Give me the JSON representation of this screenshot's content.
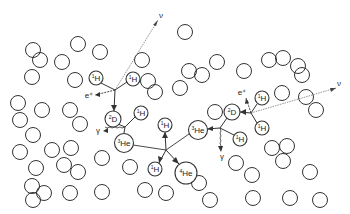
{
  "diagram": {
    "stroke_color": "#333333",
    "line_color": "#555555",
    "background": "#ffffff",
    "particle_radius": 7.5,
    "particles": [
      [
        33,
        50
      ],
      [
        40,
        60
      ],
      [
        62,
        62
      ],
      [
        78,
        44
      ],
      [
        100,
        52
      ],
      [
        32,
        77
      ],
      [
        75,
        80
      ],
      [
        18,
        103
      ],
      [
        42,
        110
      ],
      [
        70,
        110
      ],
      [
        20,
        120
      ],
      [
        33,
        135
      ],
      [
        80,
        124
      ],
      [
        20,
        152
      ],
      [
        52,
        150
      ],
      [
        71,
        148
      ],
      [
        64,
        165
      ],
      [
        78,
        172
      ],
      [
        36,
        168
      ],
      [
        32,
        186
      ],
      [
        44,
        193
      ],
      [
        70,
        193
      ],
      [
        33,
        200
      ],
      [
        102,
        158
      ],
      [
        130,
        167
      ],
      [
        102,
        192
      ],
      [
        145,
        190
      ],
      [
        166,
        193
      ],
      [
        142,
        60
      ],
      [
        148,
        81
      ],
      [
        155,
        92
      ],
      [
        180,
        88
      ],
      [
        189,
        71
      ],
      [
        217,
        62
      ],
      [
        185,
        32
      ],
      [
        202,
        75
      ],
      [
        244,
        71
      ],
      [
        269,
        60
      ],
      [
        283,
        58
      ],
      [
        298,
        66
      ],
      [
        302,
        75
      ],
      [
        306,
        97
      ],
      [
        282,
        93
      ],
      [
        316,
        110
      ],
      [
        272,
        148
      ],
      [
        287,
        146
      ],
      [
        283,
        161
      ],
      [
        252,
        175
      ],
      [
        310,
        172
      ],
      [
        199,
        183
      ],
      [
        210,
        200
      ],
      [
        253,
        198
      ],
      [
        290,
        198
      ],
      [
        215,
        112
      ],
      [
        236,
        163
      ],
      [
        320,
        200
      ]
    ],
    "nuclei": [
      {
        "id": "h1a",
        "iso": "1",
        "el": "H",
        "x": 96,
        "y": 78,
        "r": 7
      },
      {
        "id": "h1b",
        "iso": "1",
        "el": "H",
        "x": 133,
        "y": 79,
        "r": 7
      },
      {
        "id": "d1",
        "iso": "2",
        "el": "D",
        "x": 113,
        "y": 119,
        "r": 8
      },
      {
        "id": "h1c",
        "iso": "1",
        "el": "H",
        "x": 141,
        "y": 113,
        "r": 7
      },
      {
        "id": "he3a",
        "iso": "3",
        "el": "He",
        "x": 124,
        "y": 143,
        "r": 9.5
      },
      {
        "id": "h1d",
        "iso": "1",
        "el": "H",
        "x": 165,
        "y": 125,
        "r": 7
      },
      {
        "id": "h1e",
        "iso": "1",
        "el": "H",
        "x": 155,
        "y": 169,
        "r": 7
      },
      {
        "id": "he4",
        "iso": "4",
        "el": "He",
        "x": 186,
        "y": 173,
        "r": 11
      },
      {
        "id": "he3b",
        "iso": "3",
        "el": "He",
        "x": 198,
        "y": 130,
        "r": 9.5
      },
      {
        "id": "h1f",
        "iso": "1",
        "el": "H",
        "x": 240,
        "y": 139,
        "r": 7
      },
      {
        "id": "d2",
        "iso": "2",
        "el": "D",
        "x": 232,
        "y": 112,
        "r": 8
      },
      {
        "id": "h1g",
        "iso": "1",
        "el": "H",
        "x": 262,
        "y": 98,
        "r": 7
      },
      {
        "id": "h1h",
        "iso": "1",
        "el": "H",
        "x": 262,
        "y": 128,
        "r": 7
      }
    ],
    "labels": {
      "neutrino_1": "ν",
      "positron_1": "e⁺",
      "gamma_1": "γ",
      "neutrino_2": "ν",
      "positron_2": "e⁺",
      "gamma_2": "γ"
    },
    "label_positions": {
      "neutrino_1": [
        161,
        16
      ],
      "positron_1": [
        89,
        96
      ],
      "gamma_1": [
        98,
        131
      ],
      "neutrino_2": [
        339,
        84
      ],
      "positron_2": [
        242,
        93
      ],
      "gamma_2": [
        222,
        157
      ]
    }
  }
}
